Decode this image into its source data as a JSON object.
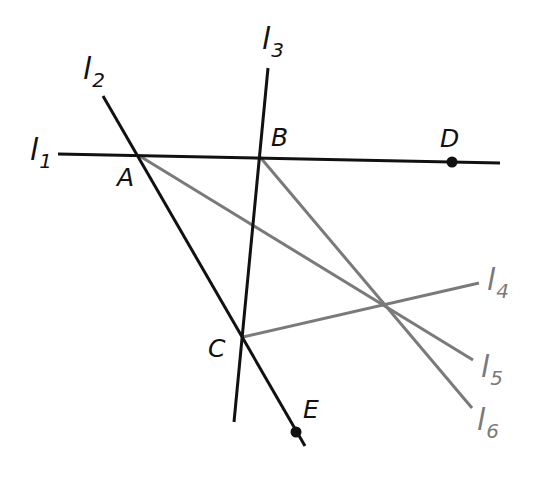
{
  "colors": {
    "black_line": "#111111",
    "gray_line": "#7a7a7a",
    "background": "#ffffff"
  },
  "lines": [
    {
      "id": "l1",
      "name": "l",
      "sub": "1",
      "color": "black",
      "from": [
        58,
        154
      ],
      "to": [
        500,
        163
      ]
    },
    {
      "id": "l2",
      "name": "l",
      "sub": "2",
      "color": "black",
      "from": [
        103,
        96
      ],
      "to": [
        305,
        446
      ]
    },
    {
      "id": "l3",
      "name": "l",
      "sub": "3",
      "color": "black",
      "from": [
        268,
        68
      ],
      "to": [
        234,
        422
      ]
    },
    {
      "id": "l4",
      "name": "l",
      "sub": "4",
      "color": "gray",
      "from": [
        243,
        337
      ],
      "to": [
        479,
        283
      ]
    },
    {
      "id": "l5",
      "name": "l",
      "sub": "5",
      "color": "gray",
      "from": [
        138,
        155
      ],
      "to": [
        473,
        360
      ]
    },
    {
      "id": "l6",
      "name": "l",
      "sub": "6",
      "color": "gray",
      "from": [
        260,
        157
      ],
      "to": [
        472,
        408
      ]
    }
  ],
  "points": [
    {
      "id": "A",
      "label": "A",
      "at": [
        138,
        155
      ],
      "dot": false
    },
    {
      "id": "B",
      "label": "B",
      "at": [
        260,
        157
      ],
      "dot": false
    },
    {
      "id": "C",
      "label": "C",
      "at": [
        243,
        337
      ],
      "dot": false
    },
    {
      "id": "D",
      "label": "D",
      "at": [
        452,
        162
      ],
      "dot": true
    },
    {
      "id": "E",
      "label": "E",
      "at": [
        296,
        432
      ],
      "dot": true
    }
  ],
  "labels": {
    "l1": {
      "main": "l",
      "sub": "1"
    },
    "l2": {
      "main": "l",
      "sub": "2"
    },
    "l3": {
      "main": "l",
      "sub": "3"
    },
    "l4": {
      "main": "l",
      "sub": "4"
    },
    "l5": {
      "main": "l",
      "sub": "5"
    },
    "l6": {
      "main": "l",
      "sub": "6"
    },
    "A": "A",
    "B": "B",
    "C": "C",
    "D": "D",
    "E": "E"
  }
}
